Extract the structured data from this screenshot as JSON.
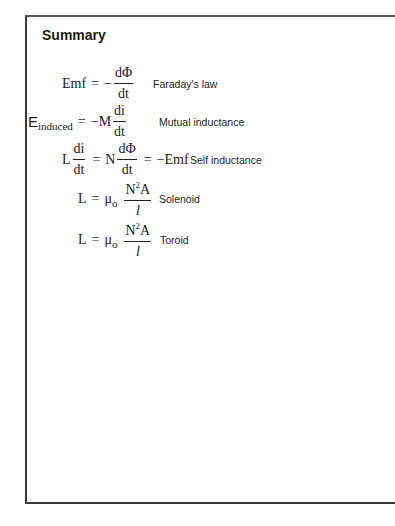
{
  "title": "Summary",
  "equations": [
    {
      "lhs": "Emf",
      "eq": "=",
      "sign": "−",
      "frac_num": "dΦ",
      "frac_den": "dt",
      "label": "Faraday's law"
    },
    {
      "lhs_main": "E",
      "lhs_sub": "induced",
      "eq": "=",
      "coef": "−M",
      "frac_num": "di",
      "frac_den": "dt",
      "label": "Mutual inductance"
    },
    {
      "lhs": "L",
      "frac1_num": "di",
      "frac1_den": "dt",
      "eq1": "=",
      "coef": "N",
      "frac2_num": "dΦ",
      "frac2_den": "dt",
      "eq2": "=",
      "rhs": "−Emf",
      "label": "Self inductance"
    },
    {
      "lhs": "L",
      "eq": "=",
      "mu": "μ",
      "mu_sub": "o",
      "frac_num_base": "N",
      "frac_num_sup": "2",
      "frac_num_rest": "A",
      "frac_den": "l",
      "label": "Solenoid"
    },
    {
      "lhs": "L",
      "eq": "=",
      "mu": "μ",
      "mu_sub": "o",
      "frac_num_base": "N",
      "frac_num_sup": "2",
      "frac_num_rest": "A",
      "frac_den": "l",
      "label": "Toroid"
    }
  ]
}
